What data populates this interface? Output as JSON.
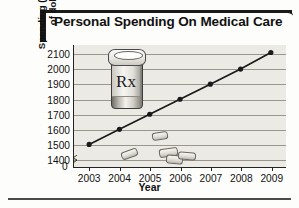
{
  "header": {
    "title": "Personal Spending On Medical Care"
  },
  "chart_data": {
    "type": "line",
    "title": "Personal Spending On Medical Care",
    "xlabel": "Year",
    "ylabel": "Spending (in billions\nof dollars)",
    "categories": [
      "2003",
      "2004",
      "2005",
      "2006",
      "2007",
      "2008",
      "2009"
    ],
    "x": [
      2003,
      2004,
      2005,
      2006,
      2007,
      2008,
      2009
    ],
    "values": [
      1500,
      1600,
      1700,
      1800,
      1900,
      2000,
      2110
    ],
    "series": [
      {
        "name": "Personal spending on medical care",
        "values": [
          1500,
          1600,
          1700,
          1800,
          1900,
          2000,
          2110
        ]
      }
    ],
    "ylim": [
      1350,
      2160
    ],
    "yticks": [
      1400,
      1500,
      1600,
      1700,
      1800,
      1900,
      2000,
      2100
    ],
    "ytick_labels": [
      "1400",
      "1500",
      "1600",
      "1700",
      "1800",
      "1900",
      "2000",
      "2100"
    ],
    "y_origin_label": "0",
    "y_axis_break": true,
    "grid": true,
    "legend": false,
    "marker": "filled-circle",
    "line_color": "#1a1a1a",
    "plot_background": "#eceae4",
    "gridline_color": "#9a968e"
  },
  "decoration": {
    "pill_bottle_label": "Rx",
    "pill_bottle_name": "prescription-bottle-illustration",
    "loose_pills_count": 5
  }
}
